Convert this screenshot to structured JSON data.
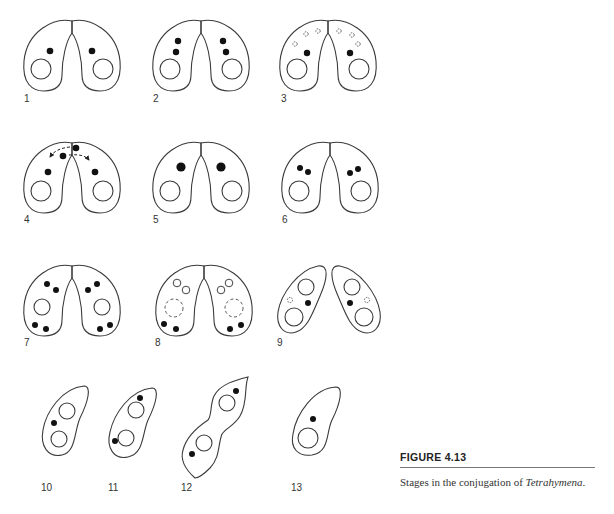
{
  "figure": {
    "title": "FIGURE 4.13",
    "caption_prefix": "Stages in the conjugation of ",
    "caption_organism": "Tetrahymena",
    "caption_suffix": "."
  },
  "stages": [
    {
      "label": "1",
      "description": "Two cells paired; each with one macronucleus and one micronucleus"
    },
    {
      "label": "2",
      "description": "Micronuclei divide (two micronuclei per cell)"
    },
    {
      "label": "3",
      "description": "Meiotic products; three degenerating micronuclei and one functional per cell"
    },
    {
      "label": "4",
      "description": "Exchange of migratory pronuclei between cells (dashed arrows)"
    },
    {
      "label": "5",
      "description": "Fusion to form a single large zygotic nucleus per cell"
    },
    {
      "label": "6",
      "description": "Zygotic nucleus divides (two nuclei per cell)"
    },
    {
      "label": "7",
      "description": "Second division (four nuclei per cell)"
    },
    {
      "label": "8",
      "description": "Two anterior nuclei enlarge; old macronucleus degenerating (dashed)"
    },
    {
      "label": "9",
      "description": "Cells separate; two new macronuclei, one micronucleus, one degenerating"
    },
    {
      "label": "10",
      "description": "Exconjugant with two macronuclei and one micronucleus"
    },
    {
      "label": "11",
      "description": "Micronucleus divides"
    },
    {
      "label": "12",
      "description": "Cell division"
    },
    {
      "label": "13",
      "description": "Daughter cell with one macronucleus and one micronucleus"
    }
  ]
}
